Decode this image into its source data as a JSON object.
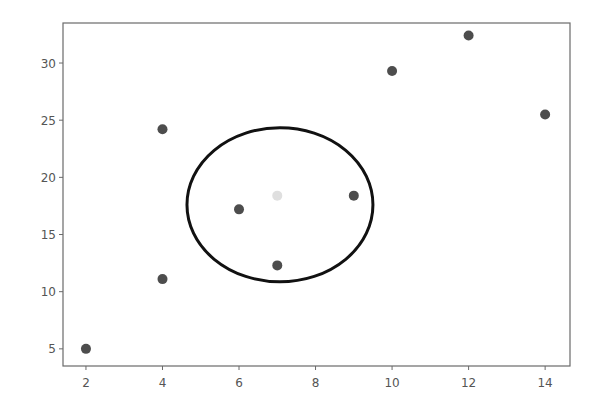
{
  "chart_data": {
    "type": "scatter",
    "title": "",
    "xlabel": "",
    "ylabel": "",
    "xlim": [
      1.4,
      14.65
    ],
    "ylim": [
      3.5,
      33.5
    ],
    "grid": false,
    "legend": null,
    "x_ticks": [
      2,
      4,
      6,
      8,
      10,
      12,
      14
    ],
    "x_tick_labels": [
      "2",
      "4",
      "6",
      "8",
      "10",
      "12",
      "14"
    ],
    "y_ticks": [
      5,
      10,
      15,
      20,
      25,
      30
    ],
    "y_tick_labels": [
      "5",
      "10",
      "15",
      "20",
      "25",
      "30"
    ],
    "series": [
      {
        "name": "points",
        "color": "#3a3a3a",
        "x": [
          2,
          4,
          4,
          6,
          7,
          9,
          10,
          12,
          14
        ],
        "y": [
          5.0,
          11.1,
          24.2,
          17.2,
          12.3,
          18.4,
          29.3,
          32.4,
          25.5
        ]
      },
      {
        "name": "highlighted-point",
        "color": "#dcdcdc",
        "x": [
          7
        ],
        "y": [
          18.4
        ]
      }
    ],
    "annotations": [
      {
        "type": "ellipse",
        "center": [
          7.07,
          17.6
        ],
        "radius_x": 2.43,
        "radius_y": 6.74,
        "stroke": "#111111",
        "stroke_width": 3,
        "fill": "none"
      }
    ]
  },
  "layout": {
    "plot_left": 63,
    "plot_right": 570,
    "plot_top": 23,
    "plot_bottom": 366,
    "marker_radius": 5,
    "point_opacity": 0.9
  }
}
